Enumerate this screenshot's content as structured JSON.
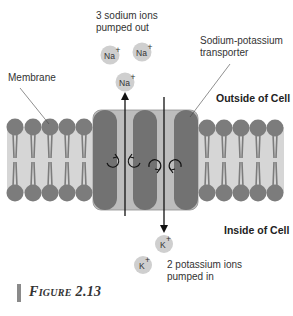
{
  "figure": {
    "caption": "Figure 2.13"
  },
  "labels": {
    "sodium_out": [
      "3 sodium ions",
      "pumped out"
    ],
    "transporter": [
      "Sodium-potassium",
      "transporter"
    ],
    "membrane": "Membrane",
    "outside": "Outside of Cell",
    "inside": "Inside of Cell",
    "potassium_in": [
      "2 potassium ions",
      "pumped in"
    ]
  },
  "ions": {
    "sodium": [
      {
        "label": "Na",
        "charge": "+",
        "x": 110,
        "y": 55
      },
      {
        "label": "Na",
        "charge": "+",
        "x": 142,
        "y": 52
      },
      {
        "label": "Na",
        "charge": "+",
        "x": 125,
        "y": 82
      }
    ],
    "potassium": [
      {
        "label": "K",
        "charge": "+",
        "x": 164,
        "y": 244
      },
      {
        "label": "K",
        "charge": "+",
        "x": 143,
        "y": 265
      }
    ]
  },
  "colors": {
    "lipid_head": "#7c7c7c",
    "lipid_band": "#d6d6d6",
    "transporter_box": "#bdbdbd",
    "transporter_pillar": "#727272",
    "ion_fill": "#cfcfcf",
    "arrow": "#111111",
    "caption_bar": "#8a8a8a"
  }
}
